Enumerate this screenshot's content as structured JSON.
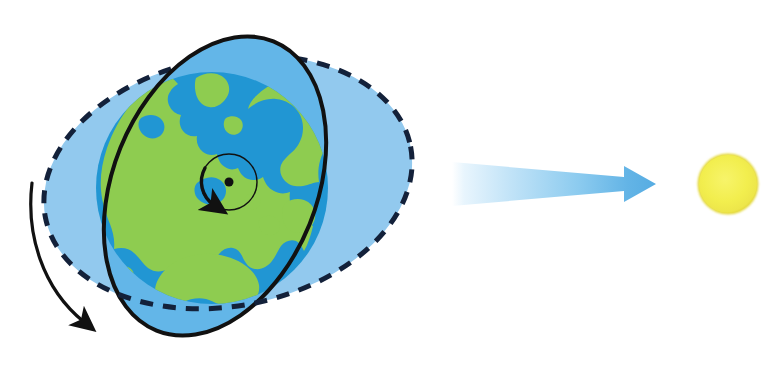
{
  "figure": {
    "kind": "earth-sun-axial-tilt-diagram",
    "background_color": "#FFFFFF",
    "width": 775,
    "height": 371,
    "title": "",
    "caption": "",
    "labels": []
  },
  "palette": {
    "ocean_blue": "#2196D3",
    "land_green": "#8ECC50",
    "equatorial_disc_blue": "#63B6E8",
    "orbital_disc_blue": "#92C9EE",
    "outline_black": "#111111",
    "dashed_navy": "#13213A",
    "sun_yellow": "#F2EE4E",
    "sun_edge": "#E8DE3A",
    "ray_blue": "#56ACE2",
    "ray_fade": "#FFFFFF"
  },
  "earth": {
    "name": "earth-globe",
    "center_x": 212,
    "center_y": 188,
    "radius": 116,
    "ocean_color": "#2196D3",
    "land_color": "#8ECC50",
    "pole_marker": {
      "name": "north-pole-dot",
      "x": 229,
      "y": 182,
      "radius": 4.5,
      "color": "#111111"
    },
    "rotation_circle": {
      "name": "rotation-path-circle",
      "center_x": 229,
      "center_y": 182,
      "radius": 28,
      "stroke": "#111111",
      "stroke_width": 1.4
    },
    "rotation_arrow": {
      "name": "rotation-direction-arrow",
      "direction": "counterclockwise",
      "stroke": "#111111",
      "stroke_width": 3
    }
  },
  "equatorial_plane": {
    "name": "equatorial-plane-ellipse",
    "center_x": 215,
    "center_y": 186,
    "rx": 102,
    "ry": 156,
    "rotation_deg": 22,
    "fill": "#63B6E8",
    "stroke": "#111111",
    "stroke_width": 4,
    "dash": "none"
  },
  "orbital_plane": {
    "name": "orbital-plane-ellipse",
    "center_x": 228,
    "center_y": 182,
    "rx": 186,
    "ry": 124,
    "rotation_deg": -11,
    "fill": "#92C9EE",
    "stroke": "#13213A",
    "stroke_width": 5,
    "dash": "13 10"
  },
  "revolution_arrow": {
    "name": "revolution-direction-arrow",
    "start_x": 32,
    "start_y": 183,
    "end_x": 92,
    "end_y": 330,
    "stroke": "#111111",
    "stroke_width": 3.2,
    "direction": "clockwise-downward"
  },
  "sunlight_ray": {
    "name": "sunlight-ray-arrow",
    "tail_x": 452,
    "tail_y": 184,
    "tip_x": 656,
    "tip_y": 184,
    "tail_half_height": 22,
    "shaft_half_height": 7,
    "head_half_height": 18,
    "head_length": 32,
    "gradient_from": "#FFFFFF",
    "gradient_to": "#56ACE2",
    "points_toward": "sun"
  },
  "sun": {
    "name": "sun-disc",
    "center_x": 728,
    "center_y": 184,
    "radius": 29,
    "fill": "#F2EE4E",
    "edge": "#E4D93C"
  }
}
